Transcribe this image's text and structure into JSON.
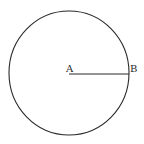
{
  "diagram": {
    "type": "geometry",
    "shape": "circle",
    "points": [
      {
        "id": "A",
        "label": "A",
        "role": "center"
      },
      {
        "id": "B",
        "label": "B",
        "role": "point on circumference"
      }
    ],
    "segments": [
      {
        "from": "A",
        "to": "B",
        "role": "radius"
      }
    ],
    "colors": {
      "stroke": "#2a2a2a",
      "background": "#ffffff"
    }
  }
}
